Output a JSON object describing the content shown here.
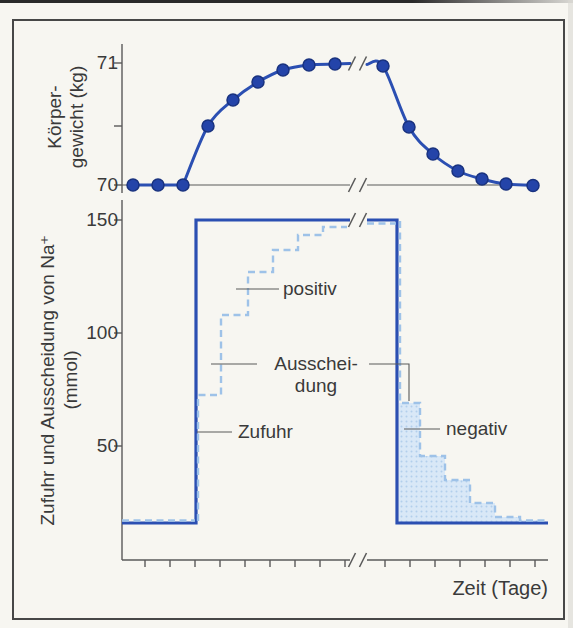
{
  "figure_caption": "",
  "chart_data": [
    {
      "type": "line",
      "name": "koerpergewicht",
      "ylabel_line1": "Körper-",
      "ylabel_line2": "gewicht (kg)",
      "yticks": [
        "71",
        "70"
      ],
      "ylim": [
        70,
        71
      ],
      "x_axis_break_after_day": 9,
      "days": [
        1,
        2,
        3,
        4,
        5,
        6,
        7,
        8,
        9,
        10,
        11,
        12,
        13,
        14,
        15,
        16
      ],
      "weight_kg": [
        70,
        70,
        70,
        70.5,
        70.7,
        70.85,
        70.94,
        70.98,
        71,
        71,
        70.5,
        70.25,
        70.12,
        70.05,
        70.01,
        70
      ]
    },
    {
      "type": "step",
      "name": "natrium-bilanz",
      "ylabel_line1": "Zufuhr und Ausscheidung von Na⁺",
      "ylabel_line2": "(mmol)",
      "xlabel": "Zeit (Tage)",
      "yticks": [
        "150",
        "100",
        "50"
      ],
      "ylim": [
        0,
        160
      ],
      "x_axis_break_after_day": 9,
      "series": [
        {
          "name": "Zufuhr",
          "style": "solid",
          "values_mmol": [
            15,
            15,
            15,
            150,
            150,
            150,
            150,
            150,
            150,
            150,
            15,
            15,
            15,
            15,
            15,
            15
          ]
        },
        {
          "name": "Ausscheidung",
          "style": "dashed",
          "values_mmol": [
            15,
            15,
            15,
            73,
            108,
            127,
            137,
            144,
            147,
            150,
            69,
            46,
            35,
            25,
            19,
            15
          ]
        }
      ],
      "annotations": {
        "positiv": "positiv",
        "ausscheidung_line1": "Ausschei-",
        "ausscheidung_line2": "dung",
        "zufuhr": "Zufuhr",
        "negativ": "negativ"
      }
    }
  ],
  "render": {
    "colors": {
      "blue": "#2b4fb2",
      "lightblue": "#9ec2e8",
      "pointfill": "#2444a9",
      "pointstroke": "#19327f",
      "axis": "#5a5a5a",
      "call": "#5a5a5a",
      "fillblue": "#d9e8f7",
      "filldot": "#b2cfec",
      "text": "#3a3a3a"
    },
    "shapes": [
      {
        "kind": "polygon",
        "name": "negative-balance-area",
        "points": [
          [
            399,
            522
          ],
          [
            399,
            403
          ],
          [
            420,
            403
          ],
          [
            420,
            456
          ],
          [
            445,
            456
          ],
          [
            445,
            480
          ],
          [
            470,
            480
          ],
          [
            470,
            503
          ],
          [
            495,
            503
          ],
          [
            495,
            517
          ],
          [
            520,
            517
          ],
          [
            520,
            520
          ],
          [
            540,
            520
          ],
          [
            540,
            522
          ]
        ]
      },
      {
        "kind": "polyline",
        "name": "weight-y-axis",
        "color": "axis",
        "w": 1.4,
        "points": [
          [
            122,
            44
          ],
          [
            122,
            193
          ]
        ]
      },
      {
        "kind": "polyline",
        "name": "na-y-axis",
        "color": "axis",
        "w": 1.4,
        "points": [
          [
            122,
            200
          ],
          [
            122,
            560
          ]
        ]
      },
      {
        "kind": "polyline",
        "name": "na-x-axis-left",
        "color": "axis",
        "w": 1.4,
        "points": [
          [
            122,
            560
          ],
          [
            350,
            560
          ]
        ]
      },
      {
        "kind": "polyline",
        "name": "na-x-axis-right",
        "color": "axis",
        "w": 1.4,
        "points": [
          [
            367,
            560
          ],
          [
            548,
            560
          ]
        ]
      },
      {
        "kind": "polyline",
        "name": "weight-baseline-left",
        "color": "axis",
        "w": 1.2,
        "points": [
          [
            122,
            185
          ],
          [
            350,
            185
          ]
        ]
      },
      {
        "kind": "polyline",
        "name": "weight-baseline-right",
        "color": "axis",
        "w": 1.2,
        "points": [
          [
            367,
            185
          ],
          [
            538,
            185
          ]
        ]
      },
      {
        "kind": "ticks",
        "dir": "y",
        "points": [
          [
            122,
            63
          ],
          [
            122,
            126
          ],
          [
            122,
            185
          ],
          [
            122,
            220
          ],
          [
            122,
            333
          ],
          [
            122,
            446
          ]
        ]
      },
      {
        "kind": "ticks",
        "dir": "x",
        "points": [
          [
            145,
            560
          ],
          [
            170,
            560
          ],
          [
            195,
            560
          ],
          [
            220,
            560
          ],
          [
            245,
            560
          ],
          [
            270,
            560
          ],
          [
            295,
            560
          ],
          [
            320,
            560
          ],
          [
            345,
            560
          ],
          [
            385,
            560
          ],
          [
            410,
            560
          ],
          [
            435,
            560
          ],
          [
            460,
            560
          ],
          [
            485,
            560
          ],
          [
            510,
            560
          ],
          [
            535,
            560
          ]
        ]
      },
      {
        "kind": "polyline",
        "name": "zufuhr-line-left",
        "color": "blue",
        "w": 3.2,
        "points": [
          [
            122,
            523
          ],
          [
            196,
            523
          ],
          [
            196,
            220
          ],
          [
            350,
            220
          ]
        ]
      },
      {
        "kind": "polyline",
        "name": "zufuhr-line-right",
        "color": "blue",
        "w": 3.2,
        "points": [
          [
            367,
            220
          ],
          [
            397,
            220
          ],
          [
            397,
            523
          ],
          [
            548,
            523
          ]
        ]
      },
      {
        "kind": "polyline",
        "name": "ausscheidung-baseline",
        "color": "lightblue",
        "w": 2.4,
        "dash": "7 4.5",
        "points": [
          [
            122,
            520.5
          ],
          [
            195,
            520.5
          ]
        ]
      },
      {
        "kind": "polyline",
        "name": "ausscheidung-rising-steps",
        "color": "lightblue",
        "w": 2.4,
        "dash": "7 4.5",
        "points": [
          [
            198,
            521
          ],
          [
            198,
            395
          ],
          [
            221,
            395
          ],
          [
            221,
            315
          ],
          [
            248,
            315
          ],
          [
            248,
            272
          ],
          [
            273,
            272
          ],
          [
            273,
            250
          ],
          [
            298,
            250
          ],
          [
            298,
            235
          ],
          [
            323,
            235
          ],
          [
            323,
            227
          ],
          [
            347,
            227
          ]
        ]
      },
      {
        "kind": "polyline",
        "name": "ausscheidung-plateau",
        "color": "lightblue",
        "w": 2.4,
        "dash": "7 4.5",
        "points": [
          [
            367,
            223.5
          ],
          [
            396,
            223.5
          ]
        ]
      },
      {
        "kind": "polyline",
        "name": "ausscheidung-falling-steps",
        "color": "lightblue",
        "w": 2.4,
        "dash": "7 4.5",
        "points": [
          [
            400,
            221
          ],
          [
            400,
            403
          ],
          [
            420,
            403
          ],
          [
            420,
            456
          ],
          [
            445,
            456
          ],
          [
            445,
            480
          ],
          [
            470,
            480
          ],
          [
            470,
            503
          ],
          [
            495,
            503
          ],
          [
            495,
            517
          ],
          [
            520,
            517
          ],
          [
            520,
            520.5
          ],
          [
            547,
            520.5
          ]
        ]
      },
      {
        "kind": "polyline",
        "name": "weight-line-flat",
        "color": "blue",
        "w": 3,
        "points": [
          [
            133,
            185
          ],
          [
            183,
            185
          ]
        ]
      },
      {
        "kind": "smooth",
        "name": "weight-line-rise",
        "color": "blue",
        "w": 3,
        "points": [
          [
            183,
            185
          ],
          [
            208,
            126
          ],
          [
            233,
            100
          ],
          [
            258,
            82
          ],
          [
            283,
            70
          ],
          [
            309,
            65
          ],
          [
            335,
            64
          ],
          [
            350,
            63.5
          ]
        ]
      },
      {
        "kind": "smooth",
        "name": "weight-line-fall",
        "color": "blue",
        "w": 3,
        "points": [
          [
            367,
            64.5
          ],
          [
            383,
            66
          ],
          [
            409,
            127
          ],
          [
            433,
            154
          ],
          [
            458,
            171
          ],
          [
            482,
            179
          ],
          [
            506,
            184
          ],
          [
            537,
            185.5
          ]
        ]
      },
      {
        "kind": "circles",
        "name": "weight-point",
        "r": 6,
        "points": [
          [
            133,
            185
          ],
          [
            158,
            185
          ],
          [
            183,
            185
          ],
          [
            208,
            126
          ],
          [
            233,
            100
          ],
          [
            258,
            82
          ],
          [
            283,
            70
          ],
          [
            309,
            65
          ],
          [
            335,
            64
          ],
          [
            383,
            66
          ],
          [
            409,
            127
          ],
          [
            433,
            154
          ],
          [
            458,
            171
          ],
          [
            482,
            179
          ],
          [
            506,
            184
          ],
          [
            533,
            185.5
          ]
        ]
      },
      {
        "kind": "polyline",
        "name": "positiv-callout",
        "color": "call",
        "w": 1.1,
        "points": [
          [
            236,
            289
          ],
          [
            279,
            289
          ]
        ]
      },
      {
        "kind": "polyline",
        "name": "ausscheidung-callout-left",
        "color": "call",
        "w": 1.1,
        "points": [
          [
            211,
            364
          ],
          [
            257,
            364
          ]
        ]
      },
      {
        "kind": "polyline",
        "name": "ausscheidung-callout-right",
        "color": "call",
        "w": 1.1,
        "points": [
          [
            369,
            364
          ],
          [
            409,
            364
          ],
          [
            409,
            401
          ]
        ]
      },
      {
        "kind": "polyline",
        "name": "zufuhr-callout",
        "color": "call",
        "w": 1.1,
        "points": [
          [
            197,
            432
          ],
          [
            232,
            432
          ]
        ]
      },
      {
        "kind": "polyline",
        "name": "negativ-callout",
        "color": "call",
        "w": 1.1,
        "points": [
          [
            404,
            429
          ],
          [
            440,
            429
          ]
        ]
      },
      {
        "kind": "slashes",
        "name": "axis-break",
        "points": [
          [
            352,
            63.5
          ],
          [
            352,
            185
          ],
          [
            352,
            220
          ],
          [
            352,
            560
          ]
        ]
      }
    ]
  }
}
